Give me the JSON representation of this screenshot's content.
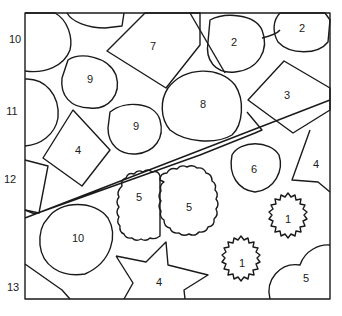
{
  "image": {
    "type": "color-by-number puzzle",
    "background": "#ffffff",
    "stroke_color": "#1a1a1a"
  },
  "regions": [
    {
      "label": "10",
      "shape": "circle",
      "x": 15,
      "y": 40
    },
    {
      "label": "7",
      "shape": "diamond",
      "x": 153,
      "y": 47
    },
    {
      "label": "2",
      "shape": "circle",
      "x": 234,
      "y": 43
    },
    {
      "label": "2",
      "shape": "circle",
      "x": 302,
      "y": 29
    },
    {
      "label": "9",
      "shape": "circle",
      "x": 90,
      "y": 80
    },
    {
      "label": "11",
      "shape": "circle",
      "x": 12,
      "y": 112
    },
    {
      "label": "8",
      "shape": "circle",
      "x": 203,
      "y": 105
    },
    {
      "label": "3",
      "shape": "diamond",
      "x": 287,
      "y": 96
    },
    {
      "label": "9",
      "shape": "circle",
      "x": 136,
      "y": 127
    },
    {
      "label": "4",
      "shape": "diamond",
      "x": 78,
      "y": 151
    },
    {
      "label": "6",
      "shape": "circle",
      "x": 254,
      "y": 170
    },
    {
      "label": "4",
      "shape": "star",
      "x": 316,
      "y": 165
    },
    {
      "label": "12",
      "shape": "quad",
      "x": 10,
      "y": 180
    },
    {
      "label": "5",
      "shape": "scalloped",
      "x": 139,
      "y": 198
    },
    {
      "label": "5",
      "shape": "scalloped",
      "x": 189,
      "y": 208
    },
    {
      "label": "1",
      "shape": "starburst",
      "x": 288,
      "y": 220
    },
    {
      "label": "10",
      "shape": "circle",
      "x": 78,
      "y": 239
    },
    {
      "label": "1",
      "shape": "starburst",
      "x": 242,
      "y": 264
    },
    {
      "label": "4",
      "shape": "star",
      "x": 159,
      "y": 283
    },
    {
      "label": "5",
      "shape": "cloud",
      "x": 306,
      "y": 279
    },
    {
      "label": "13",
      "shape": "quad",
      "x": 13,
      "y": 288
    }
  ]
}
